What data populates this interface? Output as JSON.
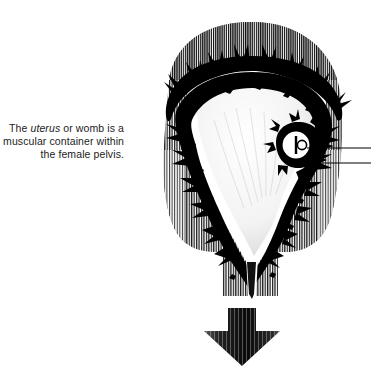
{
  "figure": {
    "background_color": "#ffffff",
    "ink_color": "#000000",
    "caption": {
      "text_before_italic": "The ",
      "italic_term": "uterus",
      "text_after_italic": " or womb is a\nmuscular container within\nthe female pelvis.",
      "full_text": "The uterus or womb is a muscular container within the female pelvis.",
      "align": "right"
    },
    "labels": {
      "leader_line_count": 2,
      "leader_line_note": "two unlabeled pointer lines running to the right edge",
      "pointer_targets": [
        "implanted embryo / gestational sac",
        "endometrial wall at implantation site"
      ]
    },
    "parts": [
      {
        "name": "fundus",
        "description": "domed upper body of the uterus, vertically hatched"
      },
      {
        "name": "myometrium",
        "description": "surrounding muscular mass rendered with fine vertical line hatching"
      },
      {
        "name": "endometrium",
        "description": "jagged black inner lining"
      },
      {
        "name": "uterine-cavity",
        "description": "pale open interior space"
      },
      {
        "name": "embryo",
        "description": "small ring-shaped implanted embryo on the right wall"
      },
      {
        "name": "cervical-canal",
        "description": "narrow channel tapering downward"
      },
      {
        "name": "flow-arrow",
        "description": "large downward arrow below the cervix, vertically hatched"
      }
    ]
  }
}
